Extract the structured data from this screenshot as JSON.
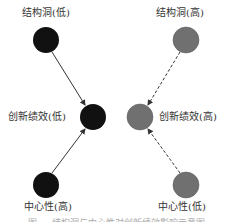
{
  "colors": {
    "low_group_node": "#111111",
    "high_group_node": "#707070",
    "edge": "#333333"
  },
  "left_panel": {
    "top_label": "结构洞(低)",
    "middle_label": "创新绩效(低)",
    "bottom_label": "中心性(高)",
    "edge_style": "solid"
  },
  "right_panel": {
    "top_label": "结构洞(高)",
    "middle_label": "创新绩效(高)",
    "bottom_label": "中心性(低)",
    "edge_style": "dashed"
  },
  "caption": "图 ... 结构洞与中心性对创新绩效影响示意图"
}
